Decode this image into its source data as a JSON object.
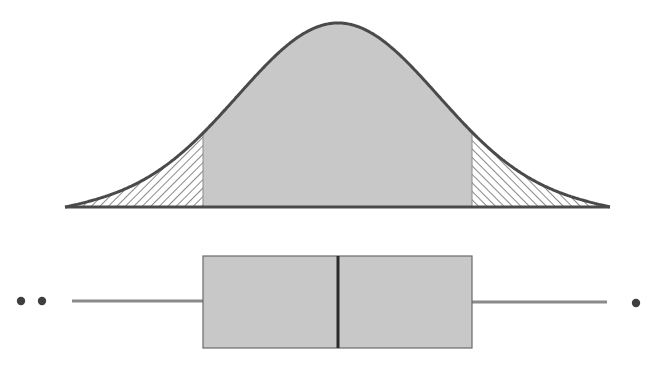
{
  "diagram": {
    "title": "",
    "colors": {
      "background": "#ffffff",
      "fill": "#c8c8c8",
      "stroke": "#4a4a4a",
      "whisker": "#8a8a8a",
      "hatch": "#6a6a6a",
      "outlier": "#3f3f3f"
    },
    "distribution": {
      "type": "normal",
      "center_x": 338,
      "sigma_px": 100,
      "baseline_y": 207,
      "peak_y": 23,
      "x_start": 65,
      "x_end": 610,
      "shaded_center": {
        "x_from": 203,
        "x_to": 472,
        "style": "solid-gray"
      },
      "left_tail": {
        "x_from": 65,
        "x_to": 203,
        "style": "hatched"
      },
      "right_tail": {
        "x_from": 472,
        "x_to": 610,
        "style": "hatched"
      }
    },
    "boxplot": {
      "y_top": 256,
      "y_bottom": 348,
      "q1_x": 203,
      "median_x": 338,
      "q3_x": 472,
      "whisker_low_x": 72,
      "whisker_high_x": 607,
      "whisker_y": 302,
      "outliers": [
        {
          "x": 21,
          "y": 301
        },
        {
          "x": 42,
          "y": 301
        },
        {
          "x": 636,
          "y": 303
        }
      ]
    }
  }
}
